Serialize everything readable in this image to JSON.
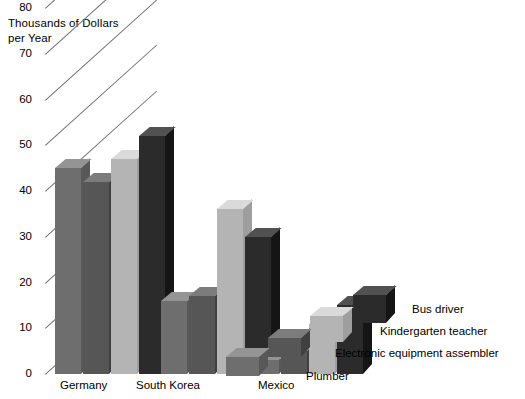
{
  "chart_data": {
    "type": "bar",
    "title": "",
    "ylabel": "Thousands of Dollars\nper Year",
    "xlabel": "",
    "ylim": [
      0,
      80
    ],
    "yticks": [
      0,
      10,
      20,
      30,
      40,
      50,
      60,
      70,
      80
    ],
    "ytick_labels": [
      "0",
      "10",
      "20",
      "30",
      "40",
      "50",
      "60",
      "70",
      "80"
    ],
    "grid": true,
    "grid_style": "diagonal-3d-depth-lines",
    "legend_position": "right-inline-staircase",
    "categories": [
      "Germany",
      "South Korea",
      "Mexico"
    ],
    "series": [
      {
        "name": "Plumber",
        "values": [
          45,
          16,
          3
        ],
        "color": "#6e6e6e"
      },
      {
        "name": "Electronic equipment assembler",
        "values": [
          42,
          17,
          5
        ],
        "color": "#565656"
      },
      {
        "name": "Kindergarten teacher",
        "values": [
          47,
          36,
          11
        ],
        "color": "#b4b4b4"
      },
      {
        "name": "Bus driver",
        "values": [
          52,
          30,
          15
        ],
        "color": "#2b2b2b"
      }
    ]
  },
  "axis": {
    "y_title": "Thousands of Dollars\nper Year",
    "ticks": [
      "80",
      "70",
      "60",
      "50",
      "40",
      "30",
      "20",
      "10",
      "0"
    ]
  },
  "groups": [
    {
      "label": "Germany"
    },
    {
      "label": "South Korea"
    },
    {
      "label": "Mexico"
    }
  ],
  "legend": [
    {
      "label": "Bus driver"
    },
    {
      "label": "Kindergarten teacher"
    },
    {
      "label": "Electronic equipment assembler"
    },
    {
      "label": "Plumber"
    }
  ],
  "colors": {
    "plumber": "#6e6e6e",
    "assembler": "#565656",
    "teacher": "#b4b4b4",
    "busdriver": "#2b2b2b",
    "gridline": "#6f6f74",
    "background": "#ffffff",
    "text": "#000000"
  }
}
